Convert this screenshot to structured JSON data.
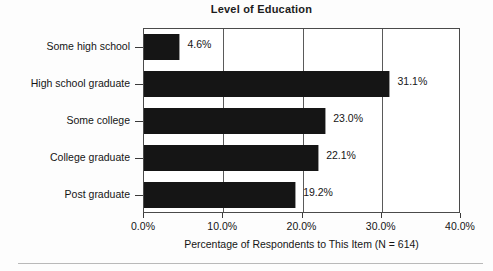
{
  "chart_data": {
    "type": "bar",
    "orientation": "horizontal",
    "title": "Level of Education",
    "xlabel": "Percentage of Respondents to This Item (N = 614)",
    "ylabel": "",
    "categories": [
      "Some high school",
      "High school graduate",
      "Some college",
      "College graduate",
      "Post graduate"
    ],
    "values": [
      4.6,
      31.1,
      23.0,
      22.1,
      19.2
    ],
    "value_labels": [
      "4.6%",
      "31.1%",
      "23.0%",
      "22.1%",
      "19.2%"
    ],
    "xlim": [
      0,
      40
    ],
    "xticks": [
      0,
      10,
      20,
      30,
      40
    ],
    "xtick_labels": [
      "0.0%",
      "10.0%",
      "20.0%",
      "30.0%",
      "40.0%"
    ],
    "grid": true,
    "legend": false,
    "bar_color": "#151515",
    "n": 614
  }
}
